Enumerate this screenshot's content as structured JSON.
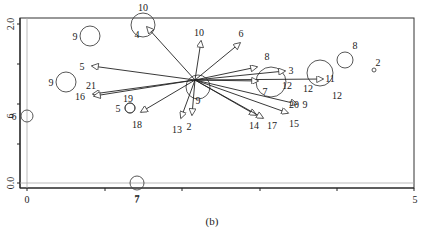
{
  "figure": {
    "caption": "(b)",
    "x_axis": {
      "ticks": [
        {
          "label": "0",
          "x": 27
        },
        {
          "label": "7",
          "x": 137
        },
        {
          "label": "5",
          "x": 415
        }
      ]
    },
    "y_axis": {
      "ticks": [
        {
          "label": "2.0",
          "y": 24
        },
        {
          "label": "6",
          "y": 116
        },
        {
          "label": "0.0",
          "y": 183
        }
      ]
    },
    "origin": {
      "x": 195,
      "y": 80
    },
    "arrows": [
      {
        "label": "10",
        "tx": 147,
        "ty": 27,
        "lx": 143,
        "ly": 11
      },
      {
        "label": "4",
        "tx": 147,
        "ty": 27,
        "lx": 137,
        "ly": 38
      },
      {
        "label": "10",
        "tx": 201,
        "ty": 41,
        "lx": 199,
        "ly": 36
      },
      {
        "label": "6",
        "tx": 240,
        "ty": 43,
        "lx": 241,
        "ly": 37
      },
      {
        "label": "8",
        "tx": 257,
        "ty": 67,
        "lx": 267,
        "ly": 60
      },
      {
        "label": "3",
        "tx": 285,
        "ty": 71,
        "lx": 291,
        "ly": 74
      },
      {
        "label": "11",
        "tx": 323,
        "ty": 79,
        "lx": 330,
        "ly": 82
      },
      {
        "label": "7",
        "tx": 258,
        "ty": 81,
        "lx": 265,
        "ly": 95
      },
      {
        "label": "5",
        "tx": 92,
        "ty": 66,
        "lx": 82,
        "ly": 70
      },
      {
        "label": "21",
        "tx": 93,
        "ty": 94,
        "lx": 91,
        "ly": 89
      },
      {
        "label": "16",
        "tx": 94,
        "ty": 96,
        "lx": 80,
        "ly": 100
      },
      {
        "label": "18",
        "tx": 141,
        "ty": 112,
        "lx": 137,
        "ly": 128
      },
      {
        "label": "13",
        "tx": 181,
        "ty": 118,
        "lx": 177,
        "ly": 133
      },
      {
        "label": "2",
        "tx": 192,
        "ty": 115,
        "lx": 189,
        "ly": 130
      },
      {
        "label": "14",
        "tx": 256,
        "ty": 115,
        "lx": 254,
        "ly": 129
      },
      {
        "label": "17",
        "tx": 263,
        "ty": 118,
        "lx": 272,
        "ly": 129
      },
      {
        "label": "15",
        "tx": 288,
        "ty": 113,
        "lx": 294,
        "ly": 127
      },
      {
        "label": "20",
        "tx": 297,
        "ty": 104,
        "lx": 294,
        "ly": 108
      },
      {
        "label": "9",
        "tx": 297,
        "ty": 104,
        "lx": 305,
        "ly": 108
      }
    ],
    "circles": [
      {
        "label": "10",
        "cx": 143,
        "cy": 25,
        "r": 12
      },
      {
        "label": "9",
        "cx": 90,
        "cy": 36,
        "r": 10,
        "lx": 75,
        "ly": 40
      },
      {
        "label": "9",
        "cx": 66,
        "cy": 82,
        "r": 10,
        "lx": 51,
        "ly": 86
      },
      {
        "label": "19",
        "cx": 130,
        "cy": 108,
        "r": 5,
        "lx": 128,
        "ly": 102
      },
      {
        "label": "5",
        "cx": 130,
        "cy": 108,
        "r": 5,
        "lx": 118,
        "ly": 112
      },
      {
        "label": "6",
        "cx": 27,
        "cy": 116,
        "r": 6,
        "lx": 14,
        "ly": 120
      },
      {
        "label": "9",
        "cx": 198,
        "cy": 87,
        "r": 12,
        "lx": 198,
        "ly": 104
      },
      {
        "label": "12",
        "cx": 271,
        "cy": 82,
        "r": 15,
        "lx": 287,
        "ly": 89
      },
      {
        "label": "12",
        "cx": 320,
        "cy": 73,
        "r": 13,
        "lx": 308,
        "ly": 92
      },
      {
        "label": "12",
        "cx": 320,
        "cy": 73,
        "r": 0,
        "lx": 337,
        "ly": 99
      },
      {
        "label": "8",
        "cx": 345,
        "cy": 60,
        "r": 8,
        "lx": 355,
        "ly": 49
      },
      {
        "label": "2",
        "cx": 374,
        "cy": 70,
        "r": 2,
        "lx": 378,
        "ly": 66
      },
      {
        "label": "7",
        "cx": 137,
        "cy": 183,
        "r": 7,
        "lx": 137,
        "ly": 202
      }
    ]
  }
}
